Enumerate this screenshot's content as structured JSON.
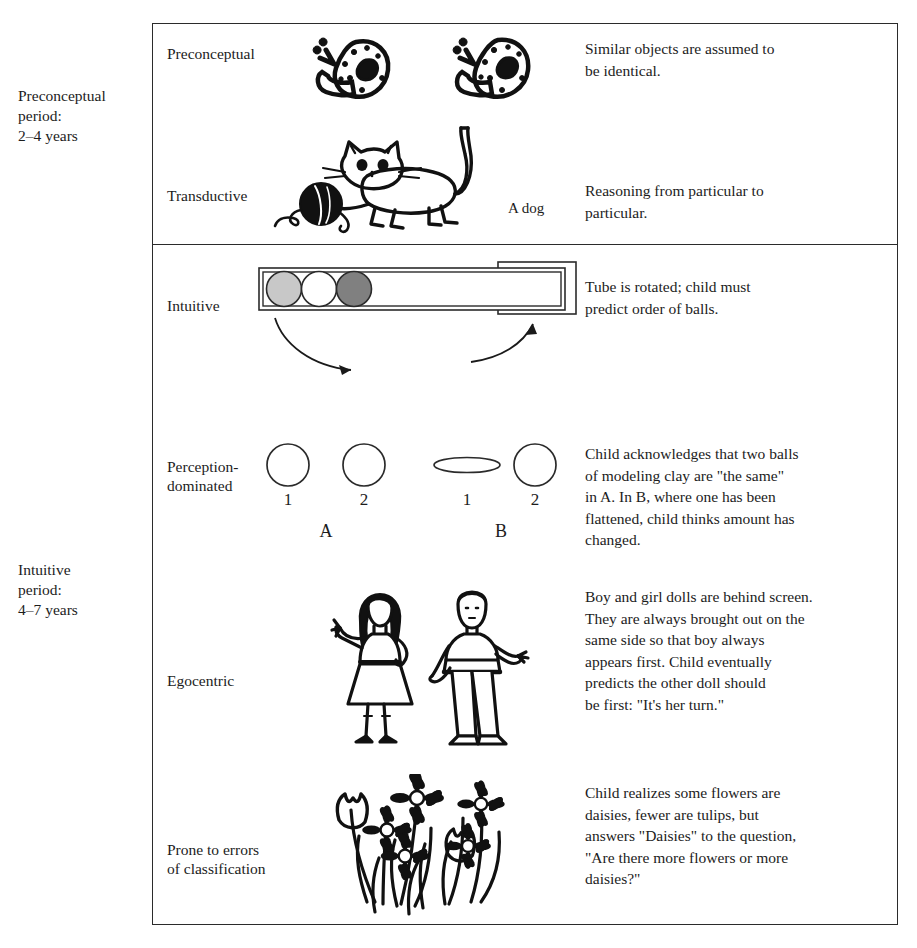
{
  "figure": {
    "periods": [
      {
        "id": "preconceptual",
        "label": "Preconceptual\nperiod:\n2–4 years"
      },
      {
        "id": "intuitive",
        "label": "Intuitive\nperiod:\n4–7 years"
      }
    ],
    "rows": [
      {
        "id": "preconceptual",
        "label": "Preconceptual",
        "description": "Similar objects are assumed to\nbe identical.",
        "art": "two-spotted-snails-illustration"
      },
      {
        "id": "transductive",
        "label": "Transductive",
        "description": "Reasoning from particular to\nparticular.",
        "art": "cat-with-yarn-ball-illustration",
        "caption": "A dog"
      },
      {
        "id": "intuitive",
        "label": "Intuitive",
        "description": "Tube is rotated; child must\npredict order of balls.",
        "art": "tube-with-three-balls-illustration",
        "balls": [
          {
            "order": 1,
            "color": "#c8c8c8",
            "name": "light-gray-ball"
          },
          {
            "order": 2,
            "color": "#ffffff",
            "name": "white-ball"
          },
          {
            "order": 3,
            "color": "#808080",
            "name": "dark-gray-ball"
          }
        ]
      },
      {
        "id": "perception-dominated",
        "label": "Perception-\ndominated",
        "description": "Child acknowledges that two balls\nof modeling clay are \"the same\"\nin A.  In B, where one has been\nflattened, child thinks amount has\nchanged.",
        "art": "clay-balls-conservation-illustration",
        "group_a": {
          "label": "A",
          "items": [
            "1",
            "2"
          ]
        },
        "group_b": {
          "label": "B",
          "items": [
            "1",
            "2"
          ]
        }
      },
      {
        "id": "egocentric",
        "label": "Egocentric",
        "description": "Boy and girl dolls are behind screen.\nThey are always brought out on the\nsame side so that boy always\nappears first.  Child eventually\npredicts the other doll should\n be first: \"It's her turn.\"",
        "art": "girl-and-boy-dolls-illustration"
      },
      {
        "id": "classification",
        "label": "Prone to errors\nof classification",
        "description": "Child realizes some flowers are\ndaisies, fewer are tulips, but\nanswers \"Daisies\" to the question,\n\"Are there more flowers or more\ndaisies?\"",
        "art": "daisies-and-tulips-bouquet-illustration"
      }
    ],
    "colors": {
      "frame": "#2b2b2b",
      "text": "#1c1c1c",
      "background": "#ffffff",
      "ink": "#111111"
    }
  }
}
